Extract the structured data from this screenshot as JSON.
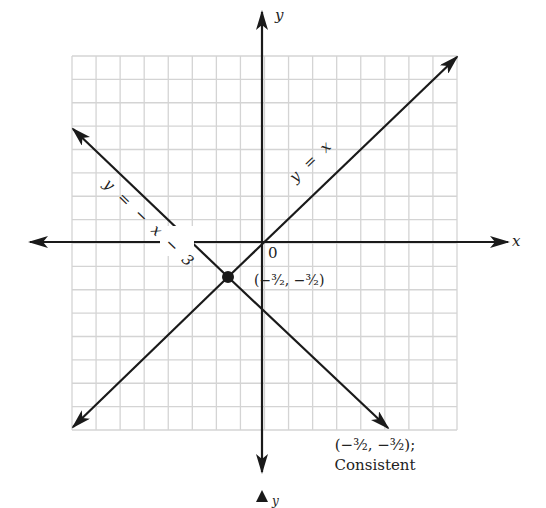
{
  "chart_data": {
    "type": "line",
    "title": "",
    "xlabel": "x",
    "ylabel": "y",
    "xlim": [
      -8,
      8
    ],
    "ylim": [
      -8,
      8
    ],
    "grid": true,
    "grid_cells": 16,
    "origin_label": "0",
    "series": [
      {
        "name": "y = x",
        "equation": "y = x",
        "slope": 1,
        "intercept": 0,
        "points": [
          [
            -7.7,
            -7.7
          ],
          [
            8,
            8
          ]
        ]
      },
      {
        "name": "y = −x − 3",
        "equation": "y = -x - 3",
        "slope": -1,
        "intercept": -3,
        "points": [
          [
            -8,
            5
          ],
          [
            5,
            -8
          ]
        ]
      }
    ],
    "annotations": [
      {
        "type": "point",
        "x": -1.5,
        "y": -1.5,
        "label": "(−³⁄₂, −³⁄₂)"
      }
    ],
    "caption": [
      "(−³⁄₂, −³⁄₂);",
      "Consistent"
    ]
  },
  "labels": {
    "x_axis": "x",
    "y_axis": "y",
    "origin": "0",
    "line1": "y = x",
    "line2": "y = − x − 3",
    "intersection": "(−³⁄₂, −³⁄₂)",
    "caption_line1": "(−³⁄₂, −³⁄₂);",
    "caption_line2": "Consistent",
    "next_fig_axis": "y"
  },
  "colors": {
    "grid": "#d4d4d4",
    "ink": "#1a1a1a"
  }
}
